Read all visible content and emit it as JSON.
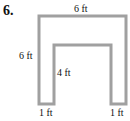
{
  "problem": {
    "number": "6."
  },
  "figure": {
    "shape": "U-shaped polygon",
    "stroke_color": "#a0a0a0",
    "labels": {
      "top": "6 ft",
      "left": "6 ft",
      "inner": "4 ft",
      "bottom_left": "1 ft",
      "bottom_right": "1 ft"
    }
  }
}
